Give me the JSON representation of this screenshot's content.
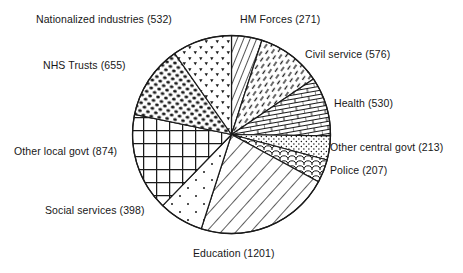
{
  "chart_data": {
    "type": "pie",
    "title": "",
    "xlabel": "",
    "ylabel": "",
    "total": 5457,
    "start_angle_deg": 0,
    "direction": "clockwise",
    "legend_position": "outside-labels",
    "grid": false,
    "categories": [
      "HM Forces",
      "Civil service",
      "Health",
      "Other central govt",
      "Police",
      "Education",
      "Social services",
      "Other local govt",
      "NHS Trusts",
      "Nationalized industries"
    ],
    "values": [
      271,
      576,
      530,
      213,
      207,
      1201,
      398,
      874,
      655,
      532
    ],
    "slices": [
      {
        "name": "HM Forces",
        "value": 271,
        "label": "HM Forces (271)",
        "percent": 5.0,
        "pattern": "dense-diagonal-lines",
        "start_deg": 0.0,
        "sweep_deg": 17.88
      },
      {
        "name": "Civil service",
        "value": 576,
        "label": "Civil service (576)",
        "percent": 10.6,
        "pattern": "dashed-diagonal-lines",
        "start_deg": 17.88,
        "sweep_deg": 38.0
      },
      {
        "name": "Health",
        "value": 530,
        "label": "Health (530)",
        "percent": 9.7,
        "pattern": "brick",
        "start_deg": 55.88,
        "sweep_deg": 34.97
      },
      {
        "name": "Other central govt",
        "value": 213,
        "label": "Other central govt (213)",
        "percent": 3.9,
        "pattern": "fine-dots",
        "start_deg": 90.85,
        "sweep_deg": 14.05
      },
      {
        "name": "Police",
        "value": 207,
        "label": "Police (207)",
        "percent": 3.8,
        "pattern": "fish-scale",
        "start_deg": 104.9,
        "sweep_deg": 13.66
      },
      {
        "name": "Education",
        "value": 1201,
        "label": "Education (1201)",
        "percent": 22.0,
        "pattern": "wide-diagonal-lines",
        "start_deg": 118.56,
        "sweep_deg": 79.24
      },
      {
        "name": "Social services",
        "value": 398,
        "label": "Social services (398)",
        "percent": 7.3,
        "pattern": "sparse-dots",
        "start_deg": 197.8,
        "sweep_deg": 26.26
      },
      {
        "name": "Other local govt",
        "value": 874,
        "label": "Other local govt (874)",
        "percent": 16.0,
        "pattern": "grid-crosshatch",
        "start_deg": 224.06,
        "sweep_deg": 57.66
      },
      {
        "name": "NHS Trusts",
        "value": 655,
        "label": "NHS Trusts (655)",
        "percent": 12.0,
        "pattern": "dense-blobs",
        "start_deg": 281.72,
        "sweep_deg": 43.22
      },
      {
        "name": "Nationalized industries",
        "value": 532,
        "label": "Nationalized industries (532)",
        "percent": 9.7,
        "pattern": "small-triangles",
        "start_deg": 324.94,
        "sweep_deg": 35.06
      }
    ]
  },
  "labels": {
    "nationalized_industries": "Nationalized industries (532)",
    "hm_forces": "HM Forces (271)",
    "nhs_trusts": "NHS Trusts (655)",
    "civil_service": "Civil service (576)",
    "health": "Health (530)",
    "other_central_govt": "Other central govt (213)",
    "police": "Police (207)",
    "other_local_govt": "Other local govt (874)",
    "social_services": "Social services (398)",
    "education": "Education (1201)"
  },
  "colors": {
    "background": "#ffffff",
    "stroke": "#1a1a1a",
    "text": "#171717",
    "fill": "#ffffff"
  }
}
